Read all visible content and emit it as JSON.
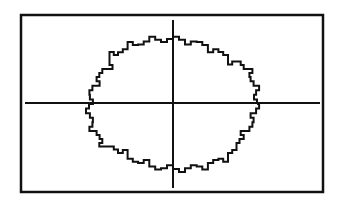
{
  "chart_data": {
    "type": "line",
    "title": "",
    "xlabel": "",
    "ylabel": "",
    "equation": "x^2 + y^2 = r^2",
    "grid": false,
    "legend": null,
    "axes": {
      "x_axis": true,
      "y_axis": true,
      "tick_labels": false
    },
    "curve": {
      "shape": "ellipse",
      "center": [
        0,
        0
      ],
      "rx_fraction_of_half_width": 0.57,
      "ry_fraction_of_half_height": 0.75,
      "steps": 44
    },
    "colors": {
      "background": "#ffffff",
      "ink": "#111111"
    }
  },
  "frame": {
    "x": 21,
    "y": 15,
    "w": 302,
    "h": 177,
    "stroke": 2.5
  },
  "axes_px": {
    "origin_x": 173,
    "origin_y": 103,
    "x_from": 25,
    "x_to": 320,
    "y_from": 20,
    "y_to": 188,
    "stroke": 2
  },
  "curve_px": {
    "cx": 173,
    "cy": 104,
    "rx": 84,
    "ry": 65,
    "steps": 44,
    "stroke": 2
  }
}
